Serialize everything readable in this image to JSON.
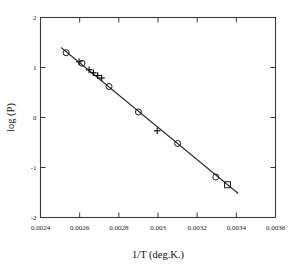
{
  "figure": {
    "background": "#ffffff",
    "foreground": "#1a1a1a"
  },
  "axis": {
    "x_title": "1/T (deg.K.)",
    "y_title": "log (P)",
    "x_ticklabels": [
      "0.0024",
      "0.0026",
      "0.0028",
      "0.003",
      "0.0032",
      "0.0034",
      "0.0036"
    ],
    "y_ticklabels": [
      "2",
      "1",
      "0",
      "-1",
      "-2"
    ]
  },
  "chart_data": {
    "type": "scatter",
    "title": "",
    "xlabel": "1/T (deg.K.)",
    "ylabel": "log (P)",
    "xlim": [
      0.0024,
      0.0036
    ],
    "ylim": [
      -2,
      2
    ],
    "xticks": [
      0.0024,
      0.0026,
      0.0028,
      0.003,
      0.0032,
      0.0034,
      0.0036
    ],
    "yticks": [
      2,
      1,
      0,
      -1,
      -2
    ],
    "grid": false,
    "legend": null,
    "series": [
      {
        "name": "circle-markers",
        "marker": "circle",
        "points": [
          {
            "x": 0.002531,
            "y": 1.295
          },
          {
            "x": 0.002612,
            "y": 1.085
          },
          {
            "x": 0.00275,
            "y": 0.62
          },
          {
            "x": 0.0029,
            "y": 0.11
          },
          {
            "x": 0.0031,
            "y": -0.52
          },
          {
            "x": 0.003295,
            "y": -1.19
          }
        ]
      },
      {
        "name": "plus-markers",
        "marker": "plus",
        "points": [
          {
            "x": 0.002597,
            "y": 1.115
          },
          {
            "x": 0.002648,
            "y": 0.955
          },
          {
            "x": 0.00267,
            "y": 0.895
          },
          {
            "x": 0.002692,
            "y": 0.84
          },
          {
            "x": 0.002712,
            "y": 0.79
          },
          {
            "x": 0.002996,
            "y": -0.265
          }
        ]
      },
      {
        "name": "square-markers",
        "marker": "square",
        "points": [
          {
            "x": 0.003355,
            "y": -1.345
          }
        ]
      }
    ],
    "fit_line": {
      "name": "linear-fit",
      "x0": 0.002505,
      "y0": 1.4,
      "x1": 0.00341,
      "y1": -1.52
    }
  }
}
